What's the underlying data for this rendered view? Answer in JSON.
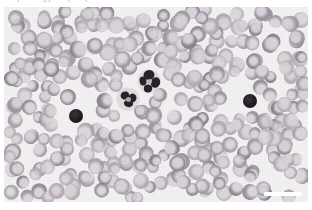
{
  "figure": {
    "kind": "light-microscopy-photomicrograph",
    "specimen": "peripheral blood smear",
    "panel": {
      "x": 4,
      "y": 7,
      "width": 304,
      "height": 195
    },
    "background_color": "#f3f1f2",
    "page_background_color": "#ffffff",
    "caption_artifact_text": "Morphology of peripheral blood smear"
  },
  "palette": {
    "erythrocyte_fill": "#9d94a0",
    "erythrocyte_fill_light": "#b3aab4",
    "erythrocyte_fill_dark": "#8b8290",
    "erythrocyte_pallor": "#d8d3d8",
    "erythrocyte_rim": "#7e7682",
    "leukocyte_nucleus": "#262027",
    "dark_cell": "#1f1a20",
    "plasma_background": "#f3f1f2",
    "scale_bar_color": "#ffffff"
  },
  "scale_bar": {
    "label": "",
    "x": 260,
    "y": 185,
    "width": 38,
    "height": 4
  },
  "cells": {
    "leukocytes": [
      {
        "name": "segmented-neutrophil-upper",
        "cx": 145,
        "cy": 74,
        "lobes": [
          {
            "cx": 0,
            "cy": -6,
            "rx": 5.5,
            "ry": 5.0,
            "rot": -18
          },
          {
            "cx": 6.5,
            "cy": 1.5,
            "rx": 4.6,
            "ry": 5.4,
            "rot": 22
          },
          {
            "cx": -1,
            "cy": 7.5,
            "rx": 4.2,
            "ry": 4.0,
            "rot": 5
          },
          {
            "cx": -6,
            "cy": 0,
            "rx": 3.4,
            "ry": 4.6,
            "rot": -8
          }
        ]
      },
      {
        "name": "segmented-neutrophil-lower",
        "cx": 124,
        "cy": 92,
        "lobes": [
          {
            "cx": -3,
            "cy": -3.5,
            "rx": 4.4,
            "ry": 4.0,
            "rot": -25
          },
          {
            "cx": 4.5,
            "cy": -1,
            "rx": 4.0,
            "ry": 4.4,
            "rot": 14
          },
          {
            "cx": 0.5,
            "cy": 4.5,
            "rx": 4.6,
            "ry": 3.6,
            "rot": 8
          }
        ]
      }
    ],
    "dark_round_cells": [
      {
        "name": "dark-cell-left",
        "cx": 72,
        "cy": 109,
        "r": 7.0
      },
      {
        "name": "dark-cell-right",
        "cx": 246,
        "cy": 94,
        "r": 7.2
      }
    ],
    "erythrocyte_count_approx": 330
  },
  "random_seed": 20240617
}
